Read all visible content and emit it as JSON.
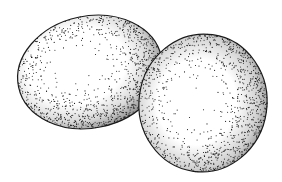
{
  "illustration": {
    "subject": "two eggs",
    "style": "stipple ink drawing",
    "background": "#ffffff",
    "ink": "#1a1a1a",
    "eggs": [
      {
        "name": "left-egg",
        "cx": 90,
        "cy": 72,
        "rx": 73,
        "ry": 56,
        "rotate": -12
      },
      {
        "name": "right-egg",
        "cx": 203,
        "cy": 103,
        "rx": 64,
        "ry": 69,
        "rotate": 8
      }
    ]
  }
}
